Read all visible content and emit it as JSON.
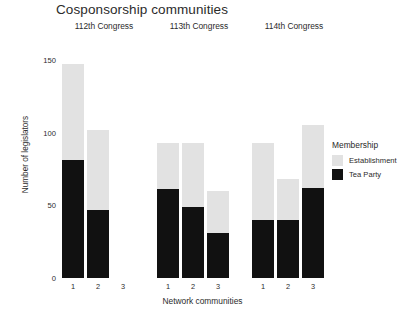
{
  "chart_data": {
    "type": "bar",
    "title": "Cosponsorship communities",
    "xlabel": "Network communities",
    "ylabel": "Number of legislators",
    "ylim": [
      0,
      150
    ],
    "yticks": [
      0,
      50,
      100,
      150
    ],
    "grid": false,
    "stacked": true,
    "legend": {
      "title": "Membership",
      "position": "right",
      "entries": [
        {
          "name": "Establishment",
          "color": "#e2e2e2"
        },
        {
          "name": "Tea Party",
          "color": "#111111"
        }
      ]
    },
    "facets": [
      {
        "label": "112th Congress",
        "categories": [
          "1",
          "2",
          "3"
        ],
        "series": [
          {
            "name": "Tea Party",
            "values": [
              81,
              47,
              0
            ]
          },
          {
            "name": "Establishment",
            "values": [
              66,
              55,
              0
            ]
          }
        ],
        "totals": [
          147,
          102,
          0
        ]
      },
      {
        "label": "113th Congress",
        "categories": [
          "1",
          "2",
          "3"
        ],
        "series": [
          {
            "name": "Tea Party",
            "values": [
              61,
              49,
              31
            ]
          },
          {
            "name": "Establishment",
            "values": [
              32,
              44,
              29
            ]
          }
        ],
        "totals": [
          93,
          93,
          60
        ]
      },
      {
        "label": "114th Congress",
        "categories": [
          "1",
          "2",
          "3"
        ],
        "series": [
          {
            "name": "Tea Party",
            "values": [
              40,
              40,
              62
            ]
          },
          {
            "name": "Establishment",
            "values": [
              53,
              28,
              43
            ]
          }
        ],
        "totals": [
          93,
          68,
          105
        ]
      }
    ]
  }
}
